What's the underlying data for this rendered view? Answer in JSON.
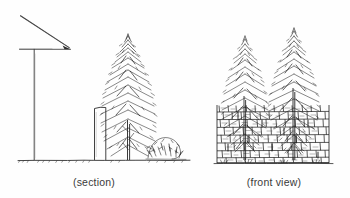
{
  "figure": {
    "background_color": "#fefefe",
    "ink_color": "#262626",
    "captions": {
      "left": "(section)",
      "right": "(front view)"
    }
  },
  "section_view": {
    "name": "section",
    "caption": "(section)",
    "elements": [
      {
        "name": "sight-line",
        "type": "diagonal-line",
        "description": "sloping sight line from upper left down to angle vertex",
        "from": [
          20,
          16
        ],
        "to": [
          69,
          48
        ]
      },
      {
        "name": "horizontal-reference-line",
        "type": "line",
        "description": "horizontal line from pole crossbar to angle vertex",
        "from": [
          20,
          49
        ],
        "to": [
          70,
          49
        ]
      },
      {
        "name": "angle-vertex-arrowhead",
        "type": "arrowhead",
        "position": [
          69,
          48
        ]
      },
      {
        "name": "vertical-pole",
        "type": "line",
        "description": "vertical viewing pole standing on the ground line",
        "from": [
          34,
          49
        ],
        "to": [
          34,
          160
        ]
      },
      {
        "name": "ground-line",
        "type": "line",
        "description": "hand drawn ground line with tick hatching",
        "from": [
          18,
          160
        ],
        "to": [
          190,
          160
        ]
      },
      {
        "name": "wall-in-section",
        "type": "rectangle",
        "description": "narrow wall cut shown in section",
        "x": 94,
        "y": 108,
        "width": 12,
        "height": 52
      },
      {
        "name": "conifer-tree-section",
        "type": "tree",
        "description": "tall conifer drawn behind the wall"
      },
      {
        "name": "shrub-section",
        "type": "shrub",
        "description": "low shrub at the base right of the tree"
      }
    ]
  },
  "front_view": {
    "name": "front-view",
    "caption": "(front view)",
    "elements": [
      {
        "name": "stone-wall",
        "type": "dry-stone-wall",
        "description": "random coursed hand drawn stone wall",
        "x": 217,
        "y": 105,
        "width": 112,
        "height": 58,
        "courses": 7
      },
      {
        "name": "conifer-tree-left",
        "type": "tree",
        "description": "left conifer rising above the wall"
      },
      {
        "name": "conifer-tree-right",
        "type": "tree",
        "description": "right conifer, taller, rising above the wall"
      },
      {
        "name": "ground-line-front",
        "type": "line",
        "from": [
          217,
          163
        ],
        "to": [
          331,
          163
        ]
      }
    ]
  }
}
